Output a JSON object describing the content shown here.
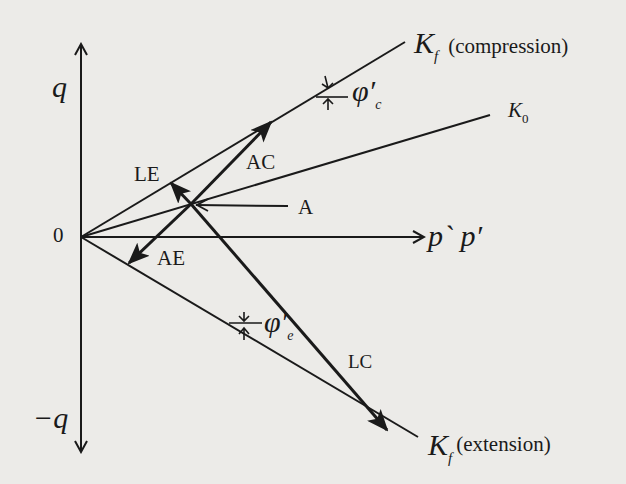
{
  "figure": {
    "type": "stress-path diagram (q vs p, p')",
    "axes": {
      "y_positive_label": "q",
      "y_negative_label": "−q",
      "origin_label": "0",
      "x_label": "p` p′"
    },
    "lines": {
      "kf_compression": {
        "symbol": "K",
        "subscript": "f",
        "note": "(compression)"
      },
      "k0": {
        "symbol": "K",
        "subscript": "0"
      },
      "kf_extension": {
        "symbol": "K",
        "subscript": "f",
        "note": "(extension)"
      }
    },
    "angles": {
      "compression": {
        "symbol": "φ′",
        "subscript": "c"
      },
      "extension": {
        "symbol": "φ′",
        "subscript": "e"
      }
    },
    "point": {
      "label": "A"
    },
    "stress_paths": [
      {
        "label": "AC",
        "description": "compression loading path from A"
      },
      {
        "label": "AE",
        "description": "extension unloading path from A"
      },
      {
        "label": "LE",
        "description": "lateral extension path from A"
      },
      {
        "label": "LC",
        "description": "lateral compression path from A"
      }
    ],
    "colors": {
      "background": "#ecebe8",
      "ink": "#1a1a1a"
    }
  }
}
